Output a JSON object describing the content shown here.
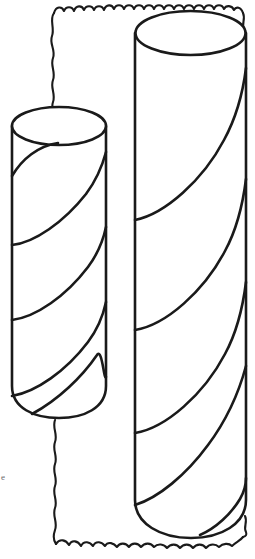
{
  "meta": {
    "canvas_width": 255,
    "canvas_height": 559,
    "background_color": "#ffffff",
    "ink_color": "#1a1a1a",
    "style": "black and white coloring-book line art"
  },
  "frame": {
    "name": "wavy-torn-paper-border",
    "description": "Irregular hand-drawn wavy rectangular border enclosing the scene",
    "stroke_color": "#1a1a1a",
    "stroke_width": 2.1,
    "left_x": 52,
    "right_x": 243,
    "top_y": 8,
    "bottom_y": 543
  },
  "objects": [
    {
      "name": "left-cylinder",
      "label": "Short striped cylinder",
      "left_x": 12,
      "right_x": 106,
      "top_y": 126,
      "bottom_y": 417,
      "ellipse_rx": 47,
      "ellipse_ry": 19,
      "stripe_count": 4,
      "stripe_direction": "spiral rising left-to-right"
    },
    {
      "name": "right-cylinder",
      "label": "Tall striped cylinder",
      "left_x": 135,
      "right_x": 246,
      "top_y": 33,
      "bottom_y": 538,
      "ellipse_rx": 55,
      "ellipse_ry": 22,
      "stripe_count": 5,
      "stripe_direction": "spiral rising left-to-right"
    }
  ],
  "annotations": {
    "corner_glyph": "e"
  }
}
